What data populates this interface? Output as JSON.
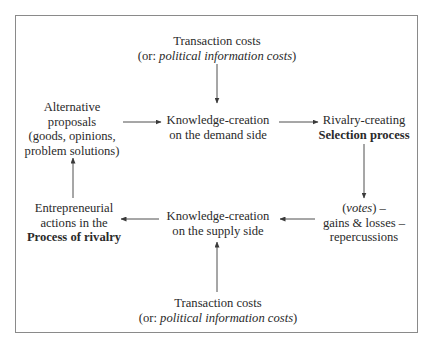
{
  "diagram": {
    "nodes": {
      "transaction_costs_top": {
        "line1": "Transaction costs",
        "line2_prefix": "(or: ",
        "line2_italic": "political information costs",
        "line2_suffix": ")"
      },
      "alternative_proposals": {
        "line1": "Alternative",
        "line2": "proposals",
        "line3": "(goods, opinions,",
        "line4": "problem solutions)"
      },
      "knowledge_demand": {
        "line1": "Knowledge-creation",
        "line2": "on the demand side"
      },
      "rivalry_selection": {
        "line1": "Rivalry-creating",
        "line2_bold": "Selection process"
      },
      "votes_gains": {
        "line1_italic": "votes",
        "line1_prefix": "(",
        "line1_suffix": ") –",
        "line2": "gains & losses –",
        "line3": "repercussions"
      },
      "knowledge_supply": {
        "line1": "Knowledge-creation",
        "line2": "on the supply side"
      },
      "entrepreneurial_actions": {
        "line1": "Entrepreneurial",
        "line2": "actions in the",
        "line3_bold": "Process of rivalry"
      },
      "transaction_costs_bottom": {
        "line1": "Transaction costs",
        "line2_prefix": "(or: ",
        "line2_italic": "political information costs",
        "line2_suffix": ")"
      }
    },
    "edges": [
      {
        "from": "transaction_costs_top",
        "to": "knowledge_demand",
        "direction": "down"
      },
      {
        "from": "alternative_proposals",
        "to": "knowledge_demand",
        "direction": "right"
      },
      {
        "from": "knowledge_demand",
        "to": "rivalry_selection",
        "direction": "right"
      },
      {
        "from": "rivalry_selection",
        "to": "votes_gains",
        "direction": "down"
      },
      {
        "from": "votes_gains",
        "to": "knowledge_supply",
        "direction": "left"
      },
      {
        "from": "knowledge_supply",
        "to": "entrepreneurial_actions",
        "direction": "left"
      },
      {
        "from": "entrepreneurial_actions",
        "to": "alternative_proposals",
        "direction": "up"
      },
      {
        "from": "transaction_costs_bottom",
        "to": "knowledge_supply",
        "direction": "up"
      }
    ],
    "colors": {
      "text": "#2a2a2a",
      "border": "#8a8a8a",
      "arrow": "#3a3a3a"
    }
  }
}
